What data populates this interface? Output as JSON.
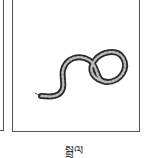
{
  "cards": [
    {
      "id": "previous",
      "partial": true
    },
    {
      "id": "current",
      "image": "snake-illustration",
      "label": "སྦྲུལ"
    }
  ],
  "colors": {
    "border": "#555555",
    "background": "#ffffff",
    "ink": "#333333"
  }
}
